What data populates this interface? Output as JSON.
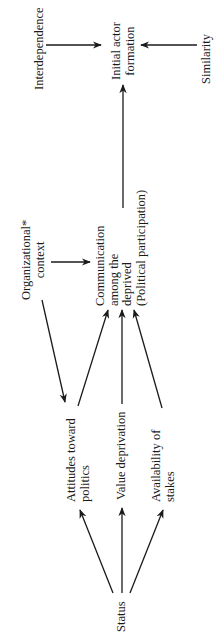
{
  "diagram": {
    "orientation": "rotated-90-ccw",
    "nodes": {
      "interdependence": {
        "lines": [
          "Interdependence"
        ]
      },
      "initial_actor_formation": {
        "lines": [
          "Initial actor",
          "formation"
        ]
      },
      "similarity": {
        "lines": [
          "Similarity"
        ]
      },
      "organizational_context": {
        "lines": [
          "Organizational*",
          "context"
        ]
      },
      "communication": {
        "lines": [
          "Communication",
          "among the",
          "deprived",
          "(Political participation)"
        ]
      },
      "attitudes": {
        "lines": [
          "Attitudes toward",
          "politics"
        ]
      },
      "value_deprivation": {
        "lines": [
          "Value deprivation"
        ]
      },
      "availability": {
        "lines": [
          "Availability of",
          "stakes"
        ]
      },
      "status": {
        "lines": [
          "Status"
        ]
      }
    },
    "edges": [
      {
        "from": "Interdependence",
        "to": "Initial actor formation"
      },
      {
        "from": "Similarity",
        "to": "Initial actor formation"
      },
      {
        "from": "Communication among the deprived",
        "to": "Initial actor formation"
      },
      {
        "from": "Organizational* context",
        "to": "Communication among the deprived"
      },
      {
        "from": "Organizational* context",
        "to": "Attitudes toward politics"
      },
      {
        "from": "Attitudes toward politics",
        "to": "Communication among the deprived"
      },
      {
        "from": "Value deprivation",
        "to": "Communication among the deprived"
      },
      {
        "from": "Availability of stakes",
        "to": "Communication among the deprived"
      },
      {
        "from": "Status",
        "to": "Attitudes toward politics"
      },
      {
        "from": "Status",
        "to": "Value deprivation"
      },
      {
        "from": "Status",
        "to": "Availability of stakes"
      }
    ],
    "colors": {
      "ink": "#1a1a1a",
      "background": "#ffffff"
    }
  }
}
